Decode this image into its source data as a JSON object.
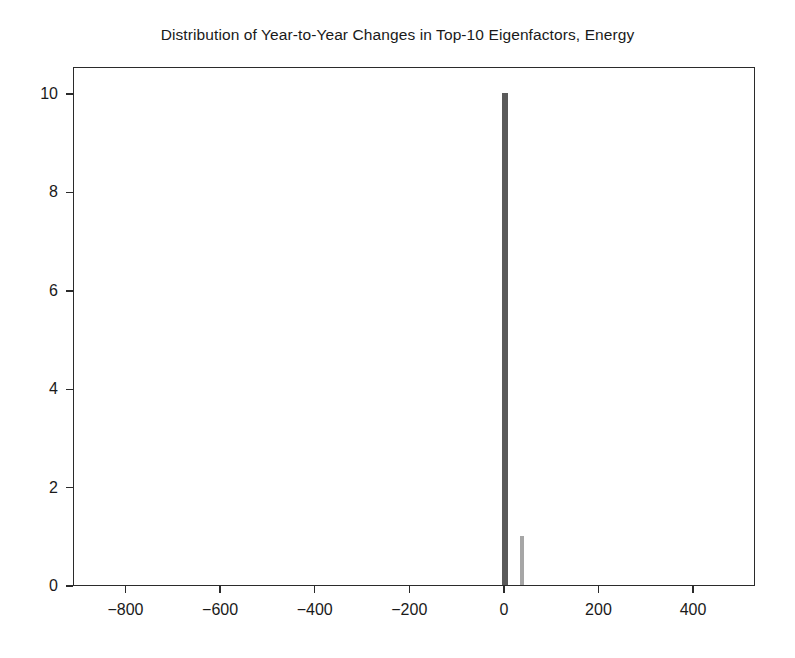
{
  "chart_data": {
    "type": "bar",
    "title": "Distribution of Year-to-Year Changes in Top-10 Eigenfactors, Energy",
    "xlabel": "",
    "ylabel": "",
    "xlim": [
      -911,
      531
    ],
    "ylim": [
      0,
      10.55
    ],
    "grid": false,
    "legend": null,
    "xticks": [
      -800,
      -600,
      -400,
      -200,
      0,
      200,
      400
    ],
    "xtick_labels": [
      "−800",
      "−600",
      "−400",
      "−200",
      "0",
      "200",
      "400"
    ],
    "yticks": [
      0,
      2,
      4,
      6,
      8,
      10
    ],
    "ytick_labels": [
      "0",
      "2",
      "4",
      "6",
      "8",
      "10"
    ],
    "bars": [
      {
        "x": 0,
        "value": 10,
        "width": 12,
        "color": "#5a5a5a"
      },
      {
        "x": 36,
        "value": 1,
        "width": 8,
        "color": "#a6a6a6"
      }
    ],
    "x": [
      0,
      36
    ],
    "values": [
      10,
      1
    ],
    "categories": [
      "0",
      "36"
    ]
  }
}
